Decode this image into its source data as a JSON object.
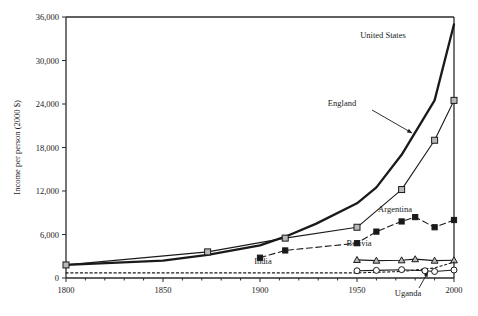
{
  "chart_data": {
    "type": "line",
    "title": "",
    "xlabel": "",
    "ylabel": "Income per person (2000 $)",
    "xlim": [
      1800,
      2000
    ],
    "ylim": [
      0,
      36000
    ],
    "xticks": [
      1800,
      1850,
      1900,
      1950,
      2000
    ],
    "xtick_labels": [
      "1800",
      "1850",
      "1900",
      "1950",
      "2000"
    ],
    "yticks": [
      0,
      6000,
      12000,
      18000,
      24000,
      30000,
      36000
    ],
    "ytick_labels": [
      "0",
      "6,000",
      "12,000",
      "18,000",
      "24,000",
      "30,000",
      "36,000"
    ],
    "grid": false,
    "legend_position": "inline-annotations",
    "series": [
      {
        "name": "United States",
        "style": "solid-thick",
        "marker": "none",
        "color": "#1a1a1a",
        "x": [
          1800,
          1850,
          1873,
          1900,
          1913,
          1929,
          1950,
          1960,
          1973,
          1990,
          2000
        ],
        "y": [
          1800,
          2400,
          3200,
          4500,
          5700,
          7500,
          10300,
          12500,
          17000,
          24500,
          35000
        ]
      },
      {
        "name": "England",
        "style": "solid-thin",
        "marker": "square-open",
        "color": "#1a1a1a",
        "x": [
          1800,
          1873,
          1913,
          1950,
          1973,
          1990,
          2000
        ],
        "y": [
          1800,
          3600,
          5500,
          7000,
          12200,
          19000,
          24500
        ]
      },
      {
        "name": "Argentina",
        "style": "dashed",
        "marker": "square-filled",
        "color": "#1a1a1a",
        "x": [
          1900,
          1913,
          1950,
          1960,
          1973,
          1980,
          1990,
          2000
        ],
        "y": [
          2800,
          3800,
          4800,
          6400,
          7800,
          8400,
          7000,
          8000
        ]
      },
      {
        "name": "Bolivia",
        "style": "solid-thin",
        "marker": "triangle-open",
        "color": "#1a1a1a",
        "x": [
          1950,
          1960,
          1973,
          1980,
          1990,
          2000
        ],
        "y": [
          2500,
          2400,
          2450,
          2600,
          2400,
          2450
        ]
      },
      {
        "name": "India",
        "style": "dotted",
        "marker": "none",
        "color": "#1a1a1a",
        "x": [
          1800,
          1850,
          1900,
          1950,
          1973,
          1990,
          2000
        ],
        "y": [
          700,
          700,
          700,
          700,
          900,
          1400,
          2200
        ]
      },
      {
        "name": "Uganda",
        "style": "solid-thin",
        "marker": "circle-open",
        "color": "#1a1a1a",
        "x": [
          1950,
          1960,
          1973,
          1985,
          1990,
          2000
        ],
        "y": [
          1000,
          1050,
          1150,
          1000,
          900,
          1100
        ]
      }
    ],
    "annotations": [
      {
        "text": "United States",
        "x_px": 383,
        "y_px": 38,
        "arrow": false
      },
      {
        "text": "England",
        "x_px": 342,
        "y_px": 106,
        "arrow": true,
        "arrow_from": [
          372,
          110
        ],
        "arrow_to": [
          412,
          133
        ]
      },
      {
        "text": "Argentina",
        "x_px": 395,
        "y_px": 212,
        "arrow": false
      },
      {
        "text": "Bolivia",
        "x_px": 359,
        "y_px": 246,
        "arrow": false
      },
      {
        "text": "India",
        "x_px": 263,
        "y_px": 264,
        "arrow": false
      },
      {
        "text": "Uganda",
        "x_px": 408,
        "y_px": 296,
        "arrow": true,
        "arrow_from": [
          419,
          288
        ],
        "arrow_to": [
          428,
          272
        ]
      }
    ]
  },
  "axis": {
    "y_title": "Income per person (2000 $)"
  },
  "colors": {
    "ink": "#1a1a1a",
    "axis": "#2b2b2b",
    "marker_fill_open": "#b8b8b8",
    "marker_fill_solid": "#1a1a1a",
    "background": "#ffffff"
  }
}
